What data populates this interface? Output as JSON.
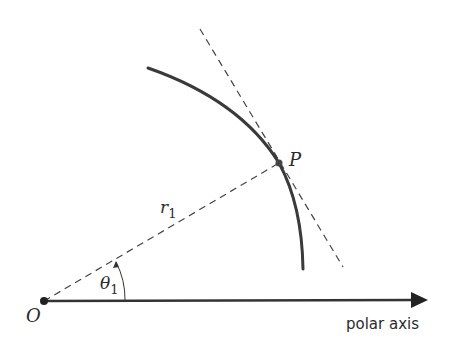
{
  "figure": {
    "labels": {
      "origin": "O",
      "point": "P",
      "radius_symbol": "r",
      "radius_subscript": "1",
      "angle_symbol": "θ",
      "angle_subscript": "1",
      "axis": "polar axis"
    },
    "colors": {
      "stroke": "#3a3a3a",
      "text": "#2b2b2b",
      "background": "#ffffff"
    }
  }
}
